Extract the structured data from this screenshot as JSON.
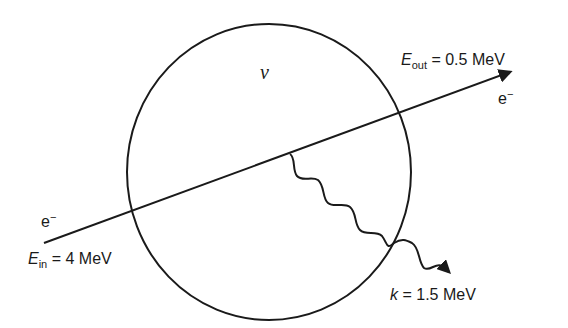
{
  "diagram": {
    "region_label": "ν",
    "incoming": {
      "particle_base": "e",
      "particle_sup": "−",
      "energy_symbol": "E",
      "energy_sub": "in",
      "energy_value": "= 4 MeV"
    },
    "outgoing": {
      "particle_base": "e",
      "particle_sup": "−",
      "energy_symbol": "E",
      "energy_sub": "out",
      "energy_value": "= 0.5 MeV"
    },
    "photon": {
      "energy_symbol": "k",
      "energy_value": "= 1.5 MeV"
    },
    "colors": {
      "stroke": "#1a1a1a",
      "background": "#ffffff"
    }
  }
}
